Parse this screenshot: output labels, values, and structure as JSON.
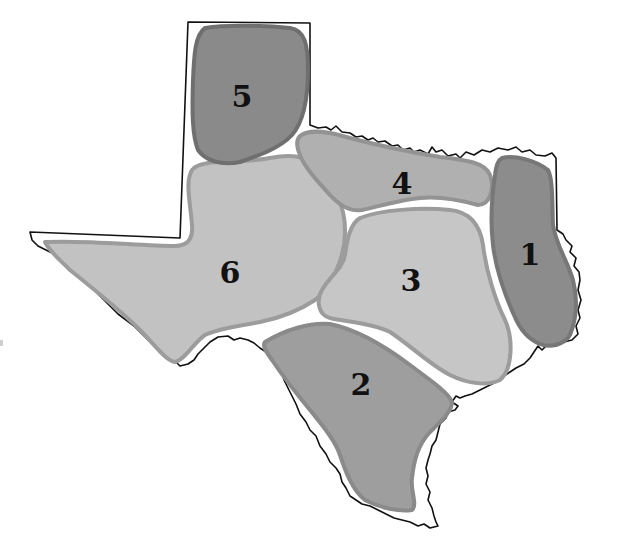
{
  "map": {
    "subject": "Texas regions",
    "background_color": "#ffffff",
    "outline_color": "#111111",
    "regions": [
      {
        "id": "1",
        "label": "1",
        "fill": "#8c8c8c",
        "stroke": "#777777"
      },
      {
        "id": "2",
        "label": "2",
        "fill": "#9e9e9e",
        "stroke": "#8a8a8a"
      },
      {
        "id": "3",
        "label": "3",
        "fill": "#c6c6c6",
        "stroke": "#9c9c9c"
      },
      {
        "id": "4",
        "label": "4",
        "fill": "#b0b0b0",
        "stroke": "#939393"
      },
      {
        "id": "5",
        "label": "5",
        "fill": "#8a8a8a",
        "stroke": "#6f6f6f"
      },
      {
        "id": "6",
        "label": "6",
        "fill": "#c2c2c2",
        "stroke": "#9c9c9c"
      }
    ]
  }
}
